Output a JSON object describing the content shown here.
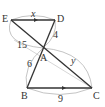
{
  "diagram": {
    "type": "geometry",
    "points": {
      "E": {
        "label": "E",
        "x": 11,
        "y": 20
      },
      "D": {
        "label": "D",
        "x": 55,
        "y": 20
      },
      "A": {
        "label": "A",
        "x": 43,
        "y": 48
      },
      "B": {
        "label": "B",
        "x": 27,
        "y": 88
      },
      "C": {
        "label": "C",
        "x": 92,
        "y": 88
      }
    },
    "segments": [
      {
        "from": "E",
        "to": "D",
        "parallel_arrow": true
      },
      {
        "from": "B",
        "to": "C",
        "parallel_arrow": true
      },
      {
        "from": "E",
        "to": "C"
      },
      {
        "from": "D",
        "to": "B"
      }
    ],
    "measurements": {
      "ED": "x",
      "DA": "4",
      "EA": "15",
      "AB": "6",
      "AC": "y",
      "BC": "9"
    },
    "colors": {
      "line": "#333333",
      "arc": "#999999"
    }
  }
}
